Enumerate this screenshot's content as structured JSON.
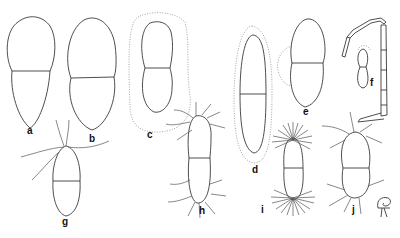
{
  "figure": {
    "type": "scientific line drawing",
    "panels": [
      {
        "label": "a",
        "description": "two-celled, broad rounded upper cell, tapered lower cell"
      },
      {
        "label": "b",
        "description": "two-celled, broad ellipsoid"
      },
      {
        "label": "c",
        "description": "two-celled, constricted at septum, with dotted mucilage envelope"
      },
      {
        "label": "d",
        "description": "elongate two-celled, with dotted envelope"
      },
      {
        "label": "e",
        "description": "two-celled with dotted lateral lobe"
      },
      {
        "label": "f",
        "description": "filament with small two-celled form"
      },
      {
        "label": "g",
        "description": "ellipsoid two-celled with long apical setae"
      },
      {
        "label": "h",
        "description": "elongate two-celled with setae at both poles"
      },
      {
        "label": "i",
        "description": "two-celled with radiating spines at both poles"
      },
      {
        "label": "j",
        "description": "two-celled with setae at both poles, with small stalked detail"
      }
    ]
  },
  "labels": {
    "a": "a",
    "b": "b",
    "c": "c",
    "d": "d",
    "e": "e",
    "f": "f",
    "g": "g",
    "h": "h",
    "i": "i",
    "j": "j"
  }
}
